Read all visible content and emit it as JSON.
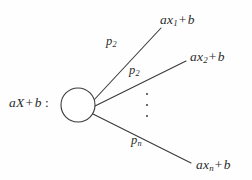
{
  "diagram": {
    "type": "probability-tree",
    "source": {
      "coefficient": "a",
      "variable": "X",
      "offset": "b",
      "label_prefix": "aX",
      "label_op": "+",
      "label_suffix": "b",
      "label_colon": ":"
    },
    "node": {
      "shape": "circle",
      "cx": 78,
      "cy": 105,
      "r": 17,
      "stroke_color": "#3a3a3a",
      "fill_color": "#ffffff"
    },
    "ellipsis": {
      "glyph": "vertical-dots",
      "dot_count": 3
    },
    "branches": [
      {
        "id": "branch-1",
        "probability_base": "p",
        "probability_sub": "2",
        "outcome_prefix": "ax",
        "outcome_sub": "1",
        "outcome_op": "+",
        "outcome_suffix": "b",
        "x1": 93,
        "y1": 101,
        "x2": 161,
        "y2": 28
      },
      {
        "id": "branch-2",
        "probability_base": "p",
        "probability_sub": "2",
        "outcome_prefix": "ax",
        "outcome_sub": "2",
        "outcome_op": "+",
        "outcome_suffix": "b",
        "x1": 95,
        "y1": 106,
        "x2": 186,
        "y2": 61
      },
      {
        "id": "branch-3",
        "probability_base": "p",
        "probability_sub": "n",
        "outcome_prefix": "ax",
        "outcome_sub": "n",
        "outcome_op": "+",
        "outcome_suffix": "b",
        "x1": 93,
        "y1": 114,
        "x2": 191,
        "y2": 163
      }
    ],
    "colors": {
      "background": "#fefefe",
      "ink": "#2b2b2b",
      "stroke": "#3a3a3a"
    }
  }
}
